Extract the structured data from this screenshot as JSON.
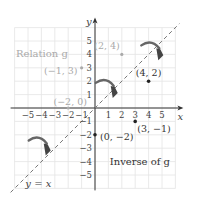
{
  "figure": {
    "axes": {
      "x_label": "x",
      "y_label": "y",
      "x_ticks": [
        -5,
        -4,
        -3,
        -2,
        -1,
        1,
        2,
        3,
        4,
        5
      ],
      "y_ticks": [
        -5,
        -4,
        -3,
        -2,
        -1,
        1,
        2,
        3,
        4,
        5
      ],
      "x_tick_labels": [
        "−5",
        "−4",
        "−3",
        "−2",
        "−1",
        "1",
        "2",
        "3",
        "4",
        "5"
      ],
      "y_tick_labels": [
        "−5",
        "−4",
        "−3",
        "−2",
        "−1",
        "1",
        "2",
        "3",
        "4",
        "5"
      ],
      "range": [
        -6,
        6
      ],
      "grid": true
    },
    "line": {
      "label": "y = x",
      "style": "dashed"
    },
    "relation": {
      "label": "Relation g",
      "color": "#aaaaaa",
      "points": [
        {
          "x": 2,
          "y": 4,
          "label": "(2, 4)"
        },
        {
          "x": -1,
          "y": 3,
          "label": "(−1, 3)"
        },
        {
          "x": -2,
          "y": 0,
          "label": "(−2, 0)"
        }
      ]
    },
    "inverse": {
      "label": "Inverse of g",
      "color": "#222222",
      "points": [
        {
          "x": 4,
          "y": 2,
          "label": "(4, 2)"
        },
        {
          "x": 3,
          "y": -1,
          "label": "(3, −1)"
        },
        {
          "x": 0,
          "y": -2,
          "label": "(0, −2)"
        }
      ]
    },
    "colors": {
      "grid": "#e4e4e4",
      "axis": "#333333",
      "dashed_line": "#777777",
      "arrow_body": "#666666",
      "tick_label": "#444444"
    }
  }
}
